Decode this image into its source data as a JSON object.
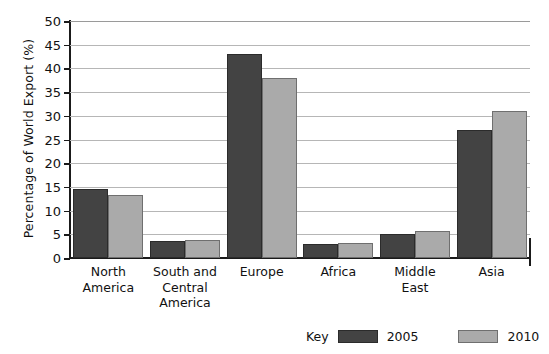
{
  "chart_data": {
    "type": "bar",
    "title": "",
    "xlabel": "",
    "ylabel": "Percentage of World Export (%)",
    "ylim": [
      0,
      50
    ],
    "ytick_step": 5,
    "yticks": [
      "0",
      "5",
      "10",
      "15",
      "20",
      "25",
      "30",
      "35",
      "40",
      "45",
      "50"
    ],
    "grid": true,
    "legend_position": "bottom-right",
    "legend_title": "Key",
    "categories": [
      "North America",
      "South and Central America",
      "Europe",
      "Africa",
      "Middle East",
      "Asia"
    ],
    "category_label_lines": [
      [
        "North",
        "America"
      ],
      [
        "South and",
        "Central",
        "America"
      ],
      [
        "Europe"
      ],
      [
        "Africa"
      ],
      [
        "Middle",
        "East"
      ],
      [
        "Asia"
      ]
    ],
    "series": [
      {
        "name": "2005",
        "color": "#434343",
        "values": [
          14.6,
          3.6,
          43.0,
          3.0,
          5.0,
          27.0
        ]
      },
      {
        "name": "2010",
        "color": "#aaaaaa",
        "values": [
          13.3,
          3.9,
          38.0,
          3.1,
          5.6,
          31.0
        ]
      }
    ]
  },
  "colors": {
    "series_2005": "#434343",
    "series_2010": "#aaaaaa",
    "axis": "#1a1a1a",
    "gridline": "#b6b6b6",
    "background": "#ffffff"
  }
}
